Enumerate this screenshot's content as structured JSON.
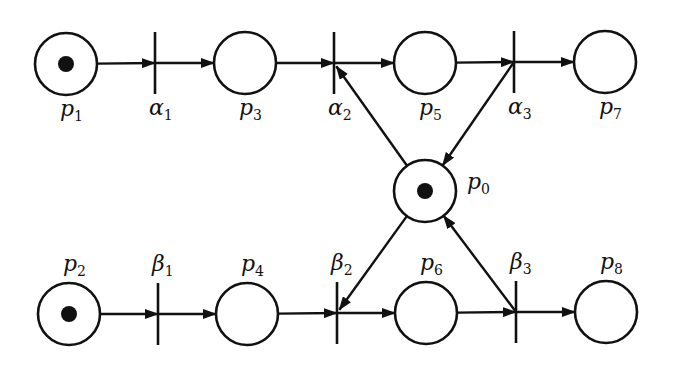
{
  "diagram": {
    "type": "petri-net",
    "places": [
      {
        "id": "p1",
        "name": "p",
        "sub": "1",
        "x": 66,
        "y": 64,
        "token": true,
        "label_pos": "below"
      },
      {
        "id": "p3",
        "name": "p",
        "sub": "3",
        "x": 245,
        "y": 63,
        "token": false,
        "label_pos": "below"
      },
      {
        "id": "p5",
        "name": "p",
        "sub": "5",
        "x": 425,
        "y": 63,
        "token": false,
        "label_pos": "below"
      },
      {
        "id": "p7",
        "name": "p",
        "sub": "7",
        "x": 605,
        "y": 62,
        "token": false,
        "label_pos": "below"
      },
      {
        "id": "p0",
        "name": "p",
        "sub": "0",
        "x": 425,
        "y": 191,
        "token": true,
        "label_pos": "right"
      },
      {
        "id": "p2",
        "name": "p",
        "sub": "2",
        "x": 69,
        "y": 314,
        "token": true,
        "label_pos": "above"
      },
      {
        "id": "p4",
        "name": "p",
        "sub": "4",
        "x": 247,
        "y": 314,
        "token": false,
        "label_pos": "above"
      },
      {
        "id": "p6",
        "name": "p",
        "sub": "6",
        "x": 426,
        "y": 313,
        "token": false,
        "label_pos": "above"
      },
      {
        "id": "p8",
        "name": "p",
        "sub": "8",
        "x": 606,
        "y": 312,
        "token": false,
        "label_pos": "above"
      }
    ],
    "transitions": [
      {
        "id": "alpha1",
        "name": "α",
        "sub": "1",
        "x": 155,
        "y": 63,
        "label_pos": "below"
      },
      {
        "id": "alpha2",
        "name": "α",
        "sub": "2",
        "x": 334,
        "y": 63,
        "label_pos": "below"
      },
      {
        "id": "alpha3",
        "name": "α",
        "sub": "3",
        "x": 514,
        "y": 62,
        "label_pos": "below"
      },
      {
        "id": "beta1",
        "name": "β",
        "sub": "1",
        "x": 158,
        "y": 314,
        "label_pos": "above"
      },
      {
        "id": "beta2",
        "name": "β",
        "sub": "2",
        "x": 337,
        "y": 313,
        "label_pos": "above"
      },
      {
        "id": "beta3",
        "name": "β",
        "sub": "3",
        "x": 516,
        "y": 312,
        "label_pos": "above"
      }
    ],
    "arcs": [
      {
        "from": "p1",
        "to": "alpha1"
      },
      {
        "from": "alpha1",
        "to": "p3"
      },
      {
        "from": "p3",
        "to": "alpha2"
      },
      {
        "from": "alpha2",
        "to": "p5"
      },
      {
        "from": "p5",
        "to": "alpha3"
      },
      {
        "from": "alpha3",
        "to": "p7"
      },
      {
        "from": "p0",
        "to": "alpha2"
      },
      {
        "from": "alpha3",
        "to": "p0"
      },
      {
        "from": "p2",
        "to": "beta1"
      },
      {
        "from": "beta1",
        "to": "p4"
      },
      {
        "from": "p4",
        "to": "beta2"
      },
      {
        "from": "beta2",
        "to": "p6"
      },
      {
        "from": "p6",
        "to": "beta3"
      },
      {
        "from": "beta3",
        "to": "p8"
      },
      {
        "from": "p0",
        "to": "beta2"
      },
      {
        "from": "beta3",
        "to": "p0"
      }
    ],
    "style": {
      "stroke": "#111111",
      "background": "#ffffff",
      "place_radius": 31,
      "token_radius": 8,
      "transition_half_height": 31
    }
  }
}
